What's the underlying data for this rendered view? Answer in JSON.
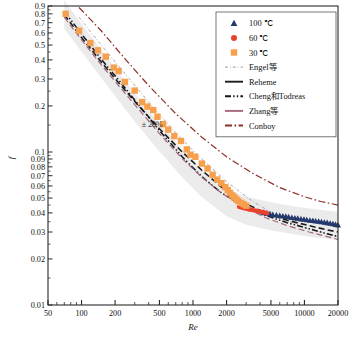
{
  "chart_data": {
    "type": "scatter",
    "title": "",
    "xlabel": "Re",
    "ylabel": "f",
    "xscale": "log",
    "yscale": "log",
    "xlim": [
      50,
      20000
    ],
    "ylim": [
      0.01,
      0.9
    ],
    "grid": false,
    "legend_position": "top-right",
    "xticks": [
      50,
      100,
      200,
      500,
      1000,
      2000,
      5000,
      10000,
      20000
    ],
    "xtick_labels": [
      "50",
      "100",
      "200",
      "500",
      "1000",
      "2000",
      "5000",
      "10000",
      "20000"
    ],
    "yticks": [
      0.01,
      0.02,
      0.03,
      0.04,
      0.05,
      0.06,
      0.07,
      0.08,
      0.09,
      0.1,
      0.2,
      0.3,
      0.4,
      0.5,
      0.6,
      0.7,
      0.8,
      0.9
    ],
    "ytick_labels": [
      "0.01",
      "0.02",
      "0.03",
      "0.04",
      "0.05",
      "0.06",
      "0.07",
      "0.08",
      "0.09",
      "0.1",
      "0.2",
      "0.3",
      "0.4",
      "0.5",
      "0.6",
      "0.7",
      "0.8",
      "0.9"
    ],
    "annotations": [
      {
        "text": "± 20%",
        "x": 430,
        "y": 0.145
      }
    ],
    "band": {
      "label": "± 20% band",
      "color": "#e8e8e8",
      "x": [
        70,
        100,
        150,
        200,
        300,
        500,
        800,
        1200,
        2000,
        3000,
        5000,
        8000,
        12000,
        20000
      ],
      "center": [
        0.8,
        0.565,
        0.382,
        0.29,
        0.198,
        0.126,
        0.0855,
        0.0635,
        0.0475,
        0.0418,
        0.0385,
        0.0362,
        0.0347,
        0.0333
      ]
    },
    "series": [
      {
        "name": "100 ℃",
        "marker": "triangle",
        "color": "#23386b",
        "points": [
          [
            4300,
            0.04
          ],
          [
            4600,
            0.0396
          ],
          [
            4900,
            0.0392
          ],
          [
            5200,
            0.0389
          ],
          [
            5600,
            0.0386
          ],
          [
            6000,
            0.0383
          ],
          [
            6400,
            0.038
          ],
          [
            6800,
            0.0378
          ],
          [
            7200,
            0.0375
          ],
          [
            7700,
            0.0372
          ],
          [
            8200,
            0.0369
          ],
          [
            8700,
            0.0367
          ],
          [
            9300,
            0.0364
          ],
          [
            9900,
            0.0362
          ],
          [
            10500,
            0.0359
          ],
          [
            11200,
            0.0357
          ],
          [
            11900,
            0.0355
          ],
          [
            12600,
            0.0353
          ],
          [
            13400,
            0.0351
          ],
          [
            14200,
            0.0349
          ],
          [
            15100,
            0.0346
          ],
          [
            16000,
            0.0344
          ],
          [
            17000,
            0.0341
          ],
          [
            18000,
            0.0338
          ],
          [
            19000,
            0.0335
          ],
          [
            20000,
            0.0332
          ]
        ]
      },
      {
        "name": "60 ℃",
        "marker": "circle",
        "color": "#e8412c",
        "points": [
          [
            2600,
            0.0438
          ],
          [
            2750,
            0.0433
          ],
          [
            2900,
            0.0429
          ],
          [
            3050,
            0.0425
          ],
          [
            3200,
            0.0421
          ],
          [
            3400,
            0.0418
          ],
          [
            3600,
            0.0414
          ],
          [
            3800,
            0.0411
          ],
          [
            4000,
            0.0407
          ],
          [
            4200,
            0.0404
          ],
          [
            4400,
            0.0401
          ],
          [
            4600,
            0.0398
          ]
        ]
      },
      {
        "name": "30 ℃",
        "marker": "square",
        "color": "#f6a04d",
        "points": [
          [
            72,
            0.8
          ],
          [
            95,
            0.62
          ],
          [
            120,
            0.515
          ],
          [
            140,
            0.462
          ],
          [
            165,
            0.42
          ],
          [
            195,
            0.356
          ],
          [
            215,
            0.338
          ],
          [
            245,
            0.287
          ],
          [
            300,
            0.252
          ],
          [
            350,
            0.212
          ],
          [
            390,
            0.198
          ],
          [
            440,
            0.188
          ],
          [
            480,
            0.17
          ],
          [
            540,
            0.152
          ],
          [
            600,
            0.14
          ],
          [
            680,
            0.127
          ],
          [
            780,
            0.118
          ],
          [
            880,
            0.104
          ],
          [
            950,
            0.096
          ],
          [
            1050,
            0.093
          ],
          [
            1200,
            0.084
          ],
          [
            1350,
            0.078
          ],
          [
            1500,
            0.071
          ],
          [
            1650,
            0.066
          ],
          [
            1800,
            0.0625
          ],
          [
            1950,
            0.059
          ],
          [
            2050,
            0.0565
          ],
          [
            2150,
            0.054
          ],
          [
            2250,
            0.052
          ],
          [
            2350,
            0.0505
          ],
          [
            2450,
            0.049
          ],
          [
            2550,
            0.0478
          ],
          [
            2700,
            0.0465
          ],
          [
            2850,
            0.0455
          ],
          [
            3000,
            0.0446
          ]
        ]
      }
    ],
    "curves": [
      {
        "name": "Engel等",
        "color": "#9a8a96",
        "dash": "dashdot-fine",
        "width": 0.8,
        "points": [
          [
            95,
            0.76
          ],
          [
            150,
            0.5
          ],
          [
            250,
            0.32
          ],
          [
            400,
            0.212
          ],
          [
            700,
            0.133
          ],
          [
            1200,
            0.09
          ],
          [
            2000,
            0.064
          ],
          [
            3500,
            0.047
          ],
          [
            6000,
            0.0375
          ],
          [
            10000,
            0.032
          ],
          [
            20000,
            0.028
          ]
        ]
      },
      {
        "name": "Reheme",
        "color": "#1c1c1c",
        "dash": "dashed",
        "width": 1.6,
        "points": [
          [
            70,
            0.79
          ],
          [
            100,
            0.56
          ],
          [
            150,
            0.388
          ],
          [
            220,
            0.278
          ],
          [
            330,
            0.198
          ],
          [
            500,
            0.142
          ],
          [
            800,
            0.1
          ],
          [
            1200,
            0.076
          ],
          [
            1800,
            0.059
          ],
          [
            2800,
            0.047
          ],
          [
            4500,
            0.0398
          ],
          [
            7000,
            0.0358
          ],
          [
            11000,
            0.033
          ],
          [
            16000,
            0.031
          ],
          [
            20000,
            0.03
          ]
        ]
      },
      {
        "name": "Cheng和Todreas",
        "color": "#14141c",
        "dash": "dashdotdot",
        "width": 1.5,
        "points": [
          [
            70,
            0.83
          ],
          [
            100,
            0.59
          ],
          [
            150,
            0.405
          ],
          [
            220,
            0.29
          ],
          [
            330,
            0.2
          ],
          [
            500,
            0.138
          ],
          [
            800,
            0.093
          ],
          [
            1200,
            0.069
          ],
          [
            1800,
            0.054
          ],
          [
            2800,
            0.0448
          ],
          [
            4500,
            0.0385
          ],
          [
            7000,
            0.0345
          ],
          [
            11000,
            0.0315
          ],
          [
            16000,
            0.0292
          ],
          [
            20000,
            0.028
          ]
        ]
      },
      {
        "name": "Zhang等",
        "color": "#a5667a",
        "dash": "dashed",
        "width": 1.2,
        "points": [
          [
            70,
            0.76
          ],
          [
            100,
            0.54
          ],
          [
            150,
            0.372
          ],
          [
            220,
            0.266
          ],
          [
            330,
            0.188
          ],
          [
            500,
            0.132
          ],
          [
            800,
            0.0905
          ],
          [
            1200,
            0.0685
          ],
          [
            1800,
            0.054
          ],
          [
            2800,
            0.044
          ],
          [
            4500,
            0.0372
          ],
          [
            7000,
            0.033
          ],
          [
            11000,
            0.03
          ],
          [
            16000,
            0.028
          ],
          [
            20000,
            0.0268
          ]
        ]
      },
      {
        "name": "Conboy",
        "color": "#8c2f26",
        "dash": "dashdot",
        "width": 1.2,
        "points": [
          [
            95,
            0.88
          ],
          [
            150,
            0.62
          ],
          [
            250,
            0.4
          ],
          [
            400,
            0.272
          ],
          [
            700,
            0.178
          ],
          [
            1200,
            0.125
          ],
          [
            2000,
            0.093
          ],
          [
            3500,
            0.072
          ],
          [
            6000,
            0.0585
          ],
          [
            10000,
            0.051
          ],
          [
            14000,
            0.0475
          ],
          [
            20000,
            0.045
          ]
        ]
      }
    ]
  },
  "legend": {
    "items": [
      {
        "label": "100 ℃",
        "kind": "marker",
        "marker": "triangle",
        "color": "#23386b"
      },
      {
        "label": "60 ℃",
        "kind": "marker",
        "marker": "circle",
        "color": "#e8412c"
      },
      {
        "label": "30 ℃",
        "kind": "marker",
        "marker": "square",
        "color": "#f6a04d"
      },
      {
        "label": "Engel等",
        "kind": "line",
        "dash": "dashdot-fine",
        "color": "#9a8a96"
      },
      {
        "label": "Reheme",
        "kind": "line",
        "dash": "solid-thick",
        "color": "#1c1c1c"
      },
      {
        "label": "Cheng和Todreas",
        "kind": "line",
        "dash": "dashdotdot",
        "color": "#14141c"
      },
      {
        "label": "Zhang等",
        "kind": "line",
        "dash": "solid-thick",
        "color": "#a5667a"
      },
      {
        "label": "Conboy",
        "kind": "line",
        "dash": "dashdot",
        "color": "#8c2f26"
      }
    ]
  }
}
